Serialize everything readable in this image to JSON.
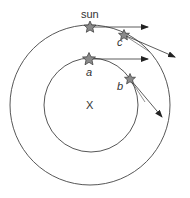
{
  "diagram": {
    "labels": {
      "sun": "sun",
      "center": "X",
      "a": "a",
      "b": "b",
      "c": "c"
    },
    "orbits": [
      {
        "name": "outer-orbit",
        "cx": 90,
        "cy": 105,
        "r": 80
      },
      {
        "name": "inner-orbit",
        "cx": 91,
        "cy": 105,
        "r": 47
      }
    ],
    "stars": [
      {
        "name": "sun",
        "x": 90,
        "y": 27
      },
      {
        "name": "c",
        "x": 124,
        "y": 35
      },
      {
        "name": "a",
        "x": 89,
        "y": 59
      },
      {
        "name": "b",
        "x": 130,
        "y": 79
      }
    ],
    "arrows": [
      {
        "from": "sun",
        "x1": 90,
        "y1": 27,
        "x2": 148,
        "y2": 27
      },
      {
        "from": "c",
        "x1": 124,
        "y1": 35,
        "x2": 175,
        "y2": 57
      },
      {
        "from": "a",
        "x1": 89,
        "y1": 59,
        "x2": 148,
        "y2": 59
      },
      {
        "from": "b",
        "x1": 130,
        "y1": 79,
        "x2": 162,
        "y2": 117
      }
    ],
    "colors": {
      "line": "#333333",
      "star_fill": "#8a8a8a",
      "star_stroke": "#333333"
    }
  }
}
